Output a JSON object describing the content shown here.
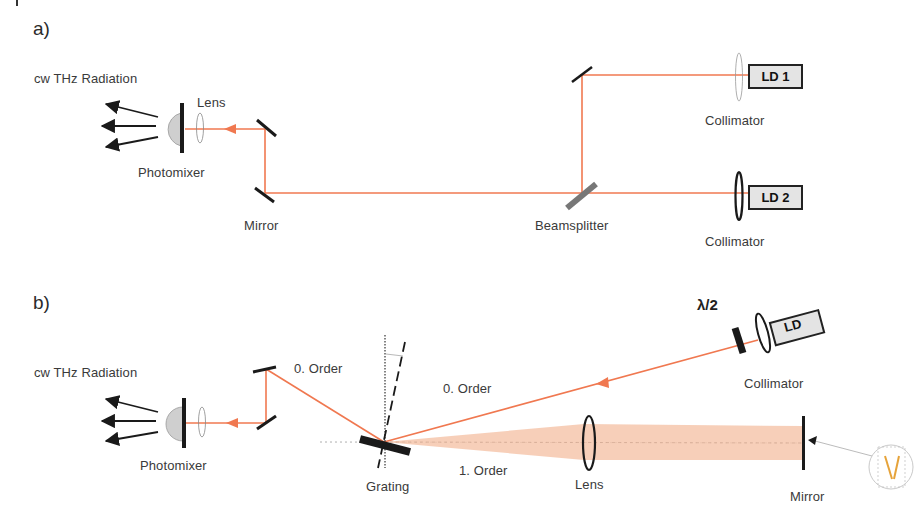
{
  "figure": {
    "panels": [
      {
        "id": "a",
        "label": "a)",
        "components": {
          "radiation": "cw THz Radiation",
          "photomixer": "Photomixer",
          "lens": "Lens",
          "mirror": "Mirror",
          "beamsplitter": "Beamsplitter",
          "collimator_1": "Collimator",
          "collimator_2": "Collimator",
          "laser_1": "LD 1",
          "laser_2": "LD 2"
        }
      },
      {
        "id": "b",
        "label": "b)",
        "components": {
          "radiation": "cw THz Radiation",
          "photomixer": "Photomixer",
          "zero_order_out": "0. Order",
          "zero_order_in": "0. Order",
          "first_order": "1. Order",
          "grating": "Grating",
          "lens": "Lens",
          "mirror": "Mirror",
          "waveplate": "λ/2",
          "collimator": "Collimator",
          "laser": "LD"
        }
      }
    ],
    "colors": {
      "beam": "#f07850",
      "beam_fan": "#f6c7ad",
      "optics": "#1a1a1a",
      "beamsplitter": "#777777",
      "laser_fill": "#e4e4e4",
      "text": "#3a3a3a"
    }
  }
}
